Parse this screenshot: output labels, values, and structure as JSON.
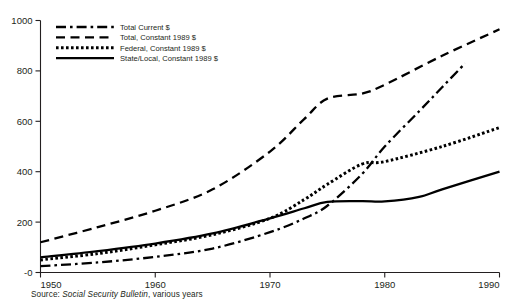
{
  "chart_data": {
    "type": "line",
    "title": "",
    "subtitle": "",
    "xlabel": "",
    "ylabel": "",
    "xlim": [
      1950,
      1990
    ],
    "ylim": [
      0,
      1000
    ],
    "xticks": [
      "1950",
      "1960",
      "1970",
      "1980",
      "1990"
    ],
    "yticks": [
      "-0",
      "200",
      "400",
      "600",
      "800",
      "1000"
    ],
    "ytick_values": [
      0,
      200,
      400,
      600,
      800,
      1000
    ],
    "xtick_values": [
      1950,
      1960,
      1970,
      1980,
      1990
    ],
    "grid": false,
    "legend_position": "top-left",
    "x": [
      1950,
      1955,
      1960,
      1965,
      1970,
      1975,
      1980,
      1985,
      1990
    ],
    "series": [
      {
        "name": "Total Current $",
        "style": "dash-dot",
        "x": [
          1950,
          1955,
          1960,
          1965,
          1970,
          1973,
          1975,
          1978,
          1980,
          1983,
          1985,
          1987
        ],
        "values": [
          25,
          40,
          62,
          95,
          160,
          215,
          265,
          390,
          500,
          640,
          735,
          830
        ]
      },
      {
        "name": "Total, Constant 1989 $",
        "style": "dashed",
        "x": [
          1950,
          1955,
          1960,
          1965,
          1970,
          1973,
          1975,
          1978,
          1980,
          1985,
          1990
        ],
        "values": [
          120,
          180,
          245,
          330,
          480,
          610,
          690,
          710,
          745,
          860,
          965
        ]
      },
      {
        "name": "Federal, Constant 1989 $",
        "style": "dotted",
        "x": [
          1950,
          1955,
          1960,
          1965,
          1970,
          1973,
          1975,
          1978,
          1980,
          1985,
          1990
        ],
        "values": [
          50,
          75,
          110,
          150,
          215,
          290,
          350,
          430,
          440,
          500,
          575
        ]
      },
      {
        "name": "State/Local, Constant 1989 $",
        "style": "solid",
        "x": [
          1950,
          1955,
          1960,
          1965,
          1970,
          1973,
          1975,
          1978,
          1980,
          1983,
          1985,
          1990
        ],
        "values": [
          60,
          85,
          115,
          155,
          215,
          255,
          280,
          283,
          282,
          300,
          330,
          400
        ]
      }
    ],
    "legend": [
      {
        "label": "Total Current $",
        "style": "dash-dot"
      },
      {
        "label": "Total, Constant 1989 $",
        "style": "dashed"
      },
      {
        "label": "Federal, Constant 1989 $",
        "style": "dotted"
      },
      {
        "label": "State/Local, Constant 1989 $",
        "style": "solid"
      }
    ],
    "source": {
      "prefix": "Source: ",
      "italic": "Social Security Bulletin",
      "suffix": ", various years"
    },
    "colors": {
      "line": "#000000",
      "axis": "#231f20",
      "text": "#231f20",
      "background": "#ffffff"
    }
  }
}
